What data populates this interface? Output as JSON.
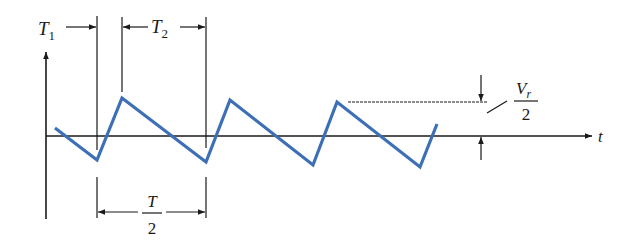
{
  "diagram": {
    "type": "sawtooth ripple waveform",
    "axes": {
      "horizontal_label": "t",
      "vertical_label": ""
    },
    "labels": {
      "t1": {
        "main": "T",
        "sub": "1"
      },
      "t2": {
        "main": "T",
        "sub": "2"
      },
      "half_period": {
        "numerator": "T",
        "denominator": "2"
      },
      "ripple": {
        "numerator_main": "V",
        "numerator_sub": "r",
        "denominator": "2"
      }
    },
    "colors": {
      "waveform": "#3d6fb6",
      "lines": "#1a1a1a"
    },
    "waveform_points": [
      [
        55,
        128
      ],
      [
        97,
        160
      ],
      [
        122,
        98
      ],
      [
        206,
        162
      ],
      [
        230,
        100
      ],
      [
        313,
        165
      ],
      [
        337,
        102
      ],
      [
        420,
        167
      ],
      [
        437,
        124
      ]
    ]
  }
}
